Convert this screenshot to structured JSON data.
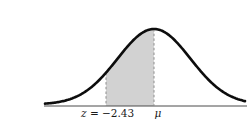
{
  "chart_data": {
    "type": "area",
    "subtype": "normal-distribution-curve",
    "title": "",
    "xlabel": "",
    "ylabel": "",
    "shaded_region": {
      "from_z": -2.43,
      "to_z": 0
    },
    "annotations": [
      {
        "name": "z-boundary",
        "symbol": "z",
        "value_text": " = −2.43",
        "z": -2.43
      },
      {
        "name": "mean",
        "symbol": "μ",
        "value_text": "",
        "z": 0
      }
    ],
    "colors": {
      "curve": "#0d0d0d",
      "shade": "#d2d2d2",
      "dashed_line": "#8e8e8e",
      "baseline": "#4a4a4a",
      "text": "#1a1a1a",
      "background": "#ffffff"
    }
  },
  "layout": {
    "width": 211,
    "height": 107,
    "mu_x": 114,
    "z_x": 66,
    "sigma_px": 36.5,
    "amplitude": 75.5,
    "base_y": 88.5,
    "baseline_y": 90,
    "baseline_x0": 4,
    "baseline_x1": 207,
    "curve_x0": 5,
    "curve_x1": 205,
    "label_y": 101,
    "z_label_x": 41,
    "mu_label_x": 118
  }
}
